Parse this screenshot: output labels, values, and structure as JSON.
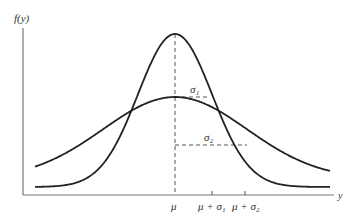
{
  "figure": {
    "ylabel": "f(y)",
    "xlabel": "y",
    "mean_label": "μ",
    "tick_labels": [
      "μ",
      "μ + σ₁",
      "μ + σ₂"
    ],
    "sigma1_label": "σ₁",
    "sigma2_label": "σ₂",
    "curves": [
      {
        "name": "narrow-normal-curve",
        "sigma": "σ₁",
        "description": "taller, narrower normal density"
      },
      {
        "name": "wide-normal-curve",
        "sigma": "σ₂",
        "description": "shorter, wider normal density"
      }
    ]
  }
}
